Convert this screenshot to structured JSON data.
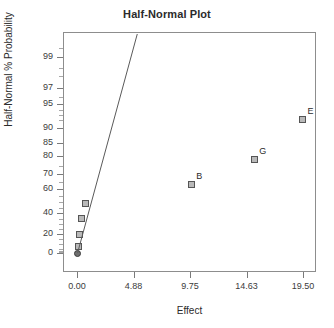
{
  "chart_data": {
    "type": "scatter",
    "title": "Half-Normal Plot",
    "xlabel": "Effect",
    "ylabel": "Half-Normal % Probability",
    "xlim": [
      0.0,
      19.5
    ],
    "ylim_prob": [
      0,
      99.5
    ],
    "grid": false,
    "legend": null,
    "xticks": [
      "0.00",
      "4.88",
      "9.75",
      "14.63",
      "19.50"
    ],
    "xtick_values": [
      0.0,
      4.88,
      9.75,
      14.63,
      19.5
    ],
    "yticks": [
      "0",
      "20",
      "40",
      "60",
      "70",
      "80",
      "85",
      "90",
      "95",
      "97",
      "99"
    ],
    "ytick_values": [
      0,
      20,
      40,
      60,
      70,
      80,
      85,
      90,
      95,
      97,
      99
    ],
    "points": [
      {
        "label": "",
        "effect": 0.05,
        "probability": 0.0,
        "marker": "circle"
      },
      {
        "label": "",
        "effect": 0.1,
        "probability": 7.0,
        "marker": "square"
      },
      {
        "label": "",
        "effect": 0.22,
        "probability": 20.0,
        "marker": "square"
      },
      {
        "label": "",
        "effect": 0.42,
        "probability": 35.0,
        "marker": "square"
      },
      {
        "label": "",
        "effect": 0.75,
        "probability": 49.0,
        "marker": "square"
      },
      {
        "label": "B",
        "effect": 9.85,
        "probability": 63.0,
        "marker": "square"
      },
      {
        "label": "G",
        "effect": 15.3,
        "probability": 78.0,
        "marker": "square"
      },
      {
        "label": "E",
        "effect": 19.45,
        "probability": 92.0,
        "marker": "square"
      }
    ],
    "reference_line": {
      "description": "half-normal reference line through origin",
      "x_start": 0.05,
      "y_start_probability": 0.5,
      "x_end": 5.2,
      "y_end_probability": 99.6
    }
  }
}
